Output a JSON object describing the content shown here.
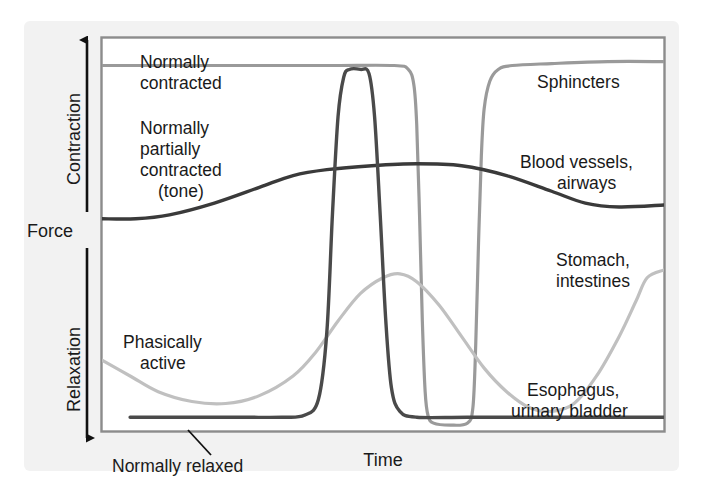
{
  "figure": {
    "name": "smooth-muscle-force-vs-time",
    "background": "#f2f2f2",
    "plot_background": "#ffffff",
    "frame_color": "#8c8c8c"
  },
  "axes": {
    "y_title": "Force",
    "y_top_label": "Contraction",
    "y_bottom_label": "Relaxation",
    "x_title": "Time",
    "arrow_color": "#111111"
  },
  "annotations": {
    "normally_contracted": "Normally\ncontracted",
    "normally_contracted_line1": "Normally",
    "normally_contracted_line2": "contracted",
    "normally_partially_contracted_line1": "Normally",
    "normally_partially_contracted_line2": "partially",
    "normally_partially_contracted_line3": "contracted",
    "normally_partially_contracted_line4": "(tone)",
    "phasically_active_line1": "Phasically",
    "phasically_active_line2": "active",
    "normally_relaxed": "Normally relaxed"
  },
  "series_labels": {
    "sphincters": "Sphincters",
    "blood_vessels_line1": "Blood vessels,",
    "blood_vessels_line2": "airways",
    "stomach_line1": "Stomach,",
    "stomach_line2": "intestines",
    "esophagus_line1": "Esophagus,",
    "esophagus_line2": "urinary bladder"
  },
  "chart_data": {
    "type": "line",
    "title": "",
    "xlabel": "Time",
    "ylabel": "Force",
    "ylim": [
      0,
      100
    ],
    "xlim": [
      0,
      100
    ],
    "grid": false,
    "legend": "inline-right-labels",
    "y_axis_semantics": {
      "top": "Contraction",
      "bottom": "Relaxation",
      "levels": {
        "normally_contracted": 93,
        "normally_partially_contracted_tone": 62,
        "normally_relaxed": 4
      }
    },
    "series": [
      {
        "name": "Sphincters",
        "color": "#9a9a9a",
        "width": 3.2,
        "description": "Tonically contracted at high force; transient complete relaxation to baseline mid-record, then return to plateau.",
        "points": [
          [
            0,
            93
          ],
          [
            20,
            93
          ],
          [
            40,
            93
          ],
          [
            52,
            93
          ],
          [
            54.5,
            92
          ],
          [
            55.5,
            88
          ],
          [
            56,
            78
          ],
          [
            56.5,
            55
          ],
          [
            57,
            28
          ],
          [
            57.5,
            10
          ],
          [
            58,
            4
          ],
          [
            59,
            2
          ],
          [
            62,
            1.5
          ],
          [
            65,
            2
          ],
          [
            66,
            6
          ],
          [
            66.5,
            22
          ],
          [
            67,
            48
          ],
          [
            67.5,
            70
          ],
          [
            68,
            82
          ],
          [
            69,
            89
          ],
          [
            70.5,
            92
          ],
          [
            73,
            93
          ],
          [
            80,
            93.5
          ],
          [
            90,
            94
          ],
          [
            100,
            94
          ]
        ]
      },
      {
        "name": "Blood vessels, airways",
        "color": "#3a3a3a",
        "width": 3.4,
        "description": "Maintains partial contraction (tone); gentle rise then slight relaxation, never reaching baseline.",
        "points": [
          [
            0,
            54
          ],
          [
            6,
            54
          ],
          [
            12,
            55
          ],
          [
            20,
            58
          ],
          [
            28,
            62
          ],
          [
            34,
            65
          ],
          [
            40,
            66.5
          ],
          [
            48,
            67.5
          ],
          [
            56,
            68
          ],
          [
            64,
            67.5
          ],
          [
            72,
            65
          ],
          [
            80,
            61
          ],
          [
            86,
            58
          ],
          [
            92,
            57
          ],
          [
            100,
            57.5
          ]
        ]
      },
      {
        "name": "Stomach, intestines",
        "color": "#c0c0c0",
        "width": 3.2,
        "description": "Phasically active: slow waves of contraction and relaxation superimposed on low baseline tone.",
        "points": [
          [
            0,
            18
          ],
          [
            5,
            14
          ],
          [
            10,
            10
          ],
          [
            16,
            7.5
          ],
          [
            22,
            7
          ],
          [
            28,
            9
          ],
          [
            34,
            14
          ],
          [
            38,
            20
          ],
          [
            42,
            28
          ],
          [
            46,
            35
          ],
          [
            50,
            39
          ],
          [
            53,
            40
          ],
          [
            56,
            38
          ],
          [
            60,
            32
          ],
          [
            64,
            24
          ],
          [
            68,
            16
          ],
          [
            72,
            10
          ],
          [
            76,
            6
          ],
          [
            80,
            5
          ],
          [
            84,
            7
          ],
          [
            88,
            14
          ],
          [
            92,
            24
          ],
          [
            95,
            33
          ],
          [
            97,
            39
          ],
          [
            100,
            41
          ]
        ]
      },
      {
        "name": "Esophagus, urinary bladder",
        "color": "#4a4a4a",
        "width": 3.4,
        "description": "Normally relaxed at baseline with a single brief, large phasic contraction.",
        "points": [
          [
            5,
            3.5
          ],
          [
            15,
            3.5
          ],
          [
            25,
            3.5
          ],
          [
            32,
            3.5
          ],
          [
            36,
            4
          ],
          [
            38.5,
            8
          ],
          [
            40,
            25
          ],
          [
            41,
            55
          ],
          [
            42,
            80
          ],
          [
            43,
            90
          ],
          [
            44,
            92
          ],
          [
            46,
            92
          ],
          [
            47.5,
            91
          ],
          [
            48.5,
            80
          ],
          [
            49.5,
            55
          ],
          [
            50.5,
            28
          ],
          [
            51.5,
            11
          ],
          [
            53,
            5
          ],
          [
            56,
            3.5
          ],
          [
            65,
            3.5
          ],
          [
            80,
            3.5
          ],
          [
            100,
            3.5
          ]
        ]
      }
    ]
  }
}
